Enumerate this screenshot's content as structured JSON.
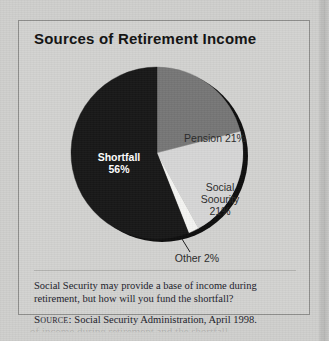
{
  "panel": {
    "title": "Sources of Retirement Income",
    "caption": "Social Security may provide a base of income during retirement, but how will you fund the shortfall?",
    "source_prefix": "Source:",
    "source_text": "Social Security Administration, April 1998."
  },
  "colors": {
    "page_background": "#cfcfcd",
    "panel_background": "#d2d2d0",
    "panel_border": "#8f8f8d",
    "shortfall": "#171717",
    "pension": "#767676",
    "social_security": "#d6d6d6",
    "other": "#f4f4f2",
    "shadow": "#0d0d0d",
    "label_dark": "#2a2a2a",
    "label_light": "#ffffff"
  },
  "chart_data": {
    "type": "pie",
    "title": "Sources of Retirement Income",
    "xlabel": "",
    "ylabel": "",
    "start_angle_deg": 0,
    "direction": "clockwise",
    "legend": "none",
    "grid": false,
    "labels": [
      "Pension",
      "Social Soourity",
      "Other",
      "Shortfall"
    ],
    "values": [
      21,
      21,
      2,
      56
    ],
    "units": "percent",
    "slices": [
      {
        "name": "Pension",
        "label": "Pension 21%",
        "value": 21,
        "color": "#767676",
        "label_color": "#2a2a2a",
        "label_lines": [
          "Pension 21%"
        ],
        "label_x": 196,
        "label_y": 93,
        "label_anchor": "middle",
        "label_bold": false
      },
      {
        "name": "Social Security",
        "label": "Social Soourity 21%",
        "value": 21,
        "color": "#d6d6d6",
        "label_color": "#2a2a2a",
        "label_lines": [
          "Social",
          "Soourity",
          "21%"
        ],
        "label_x": 201,
        "label_y": 142,
        "label_anchor": "middle",
        "label_bold": false
      },
      {
        "name": "Other",
        "label": "Other 2%",
        "value": 2,
        "color": "#f4f4f2",
        "label_color": "#2a2a2a",
        "label_lines": [
          "Other 2%"
        ],
        "label_x": 178,
        "label_y": 213,
        "label_anchor": "middle",
        "label_bold": false,
        "leader_line": {
          "x1": 163,
          "y1": 190,
          "x2": 171,
          "y2": 203
        }
      },
      {
        "name": "Shortfall",
        "label": "Shortfall 56%",
        "value": 56,
        "color": "#171717",
        "label_color": "#ffffff",
        "label_lines": [
          "Shortfall",
          "56%"
        ],
        "label_x": 100,
        "label_y": 112,
        "label_anchor": "middle",
        "label_bold": true
      }
    ],
    "geometry": {
      "center_x": 138,
      "center_y": 104,
      "radius": 86,
      "shadow_offset_x": 5,
      "shadow_offset_y": 3
    }
  },
  "bleed": {
    "text": "of income during retirement and the shortfall"
  }
}
